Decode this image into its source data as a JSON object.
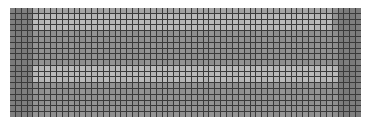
{
  "grid": {
    "cols": 60,
    "rows": 19,
    "left": 10,
    "top": 8,
    "width": 351,
    "height": 109,
    "line_color": "#3a3a3a",
    "colors": {
      "base": "#8e8e8e",
      "dark": "#7a7a7a",
      "light": "#b4b4b4",
      "mid": "#a0a0a0"
    },
    "regions": [
      {
        "name": "top-light-band",
        "row_start": 1,
        "row_end": 3,
        "col_start": 4,
        "col_end": 54,
        "tone": "light"
      },
      {
        "name": "upper-mid-band",
        "row_start": 0,
        "row_end": 0,
        "col_start": 4,
        "col_end": 54,
        "tone": "mid"
      },
      {
        "name": "lower-light-band",
        "row_start": 10,
        "row_end": 12,
        "col_start": 4,
        "col_end": 56,
        "tone": "light"
      },
      {
        "name": "left-dark-edge",
        "row_start": 0,
        "row_end": 18,
        "col_start": 0,
        "col_end": 3,
        "tone": "dark"
      },
      {
        "name": "right-dark-edge",
        "row_start": 0,
        "row_end": 18,
        "col_start": 56,
        "col_end": 59,
        "tone": "dark"
      }
    ]
  }
}
